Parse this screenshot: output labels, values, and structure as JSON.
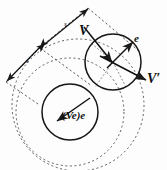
{
  "figure": {
    "name": "collision-vector-diagram",
    "background_color": "#fdfdfd",
    "ink_color": "#1a1a1a",
    "width": 167,
    "height": 170,
    "labels": {
      "incoming_velocity": "V",
      "outgoing_velocity": "V′",
      "unit_normal": "e",
      "normal_component": "(Ve)e",
      "separation_upper": "s",
      "separation_lower": "s"
    },
    "elements": {
      "solid_circle_upper_right": {
        "cx": 113,
        "cy": 62,
        "r": 28
      },
      "solid_circle_lower_left": {
        "cx": 70,
        "cy": 112,
        "r": 28
      },
      "dashed_circle_medium": {
        "cx": 70,
        "cy": 112,
        "r": 54
      },
      "dashed_circle_large": {
        "cx": 78,
        "cy": 105,
        "r": 66
      },
      "contact_point": {
        "x": 92,
        "y": 86
      },
      "upper_center": {
        "x": 113,
        "y": 62
      }
    },
    "vectors": [
      {
        "name": "V",
        "label": "V",
        "from": [
          84,
          27
        ],
        "to": [
          112,
          62
        ],
        "style": "solid"
      },
      {
        "name": "V-prime",
        "label": "V′",
        "from": [
          113,
          62
        ],
        "to": [
          147,
          80
        ],
        "style": "solid"
      },
      {
        "name": "e",
        "label": "e",
        "from": [
          113,
          62
        ],
        "to": [
          134,
          41
        ],
        "style": "solid"
      },
      {
        "name": "Ve-e",
        "label": "(Ve)e",
        "from": [
          88,
          96
        ],
        "to": [
          56,
          120
        ],
        "style": "solid"
      },
      {
        "name": "s-upper",
        "label": "s",
        "from": [
          44,
          44
        ],
        "to": [
          88,
          8
        ],
        "style": "dimension"
      },
      {
        "name": "s-lower",
        "label": "s",
        "from": [
          40,
          48
        ],
        "to": [
          6,
          82
        ],
        "style": "dimension"
      }
    ]
  }
}
